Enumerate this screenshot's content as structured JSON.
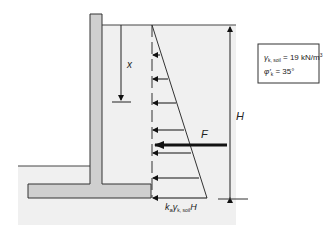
{
  "diagram": {
    "labels": {
      "depth": "x",
      "height": "H",
      "force": "F",
      "base_pressure_k": "k",
      "base_pressure_k_sub": "a",
      "base_pressure_gamma": "γ",
      "base_pressure_gamma_sub": "k, soil",
      "base_pressure_H": "H"
    },
    "properties_box": {
      "gamma_symbol": "γ",
      "gamma_sub": "k, soil",
      "gamma_value": " = 19 kN/m",
      "gamma_exp": "3",
      "phi_symbol": "φ′",
      "phi_sub": "k",
      "phi_value": " = 35°"
    },
    "pressure_arrow_depths_px": [
      55,
      79,
      103,
      130,
      153,
      178,
      198
    ],
    "colors": {
      "wall": "#cfcfcf",
      "soil": "#f0f0f0",
      "line": "#333333"
    }
  }
}
